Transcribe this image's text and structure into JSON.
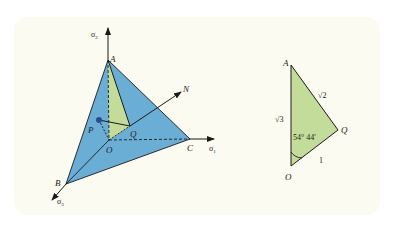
{
  "figure": {
    "background": "#fbfbf2",
    "colors": {
      "plane_fill": "#6aaed6",
      "triangle_fill": "#c4dc9a",
      "line": "#1a1a1a",
      "point": "#2e4a8f"
    },
    "left_diagram": {
      "axes": [
        {
          "label": "σ",
          "sub": "2",
          "direction": "up"
        },
        {
          "label": "σ",
          "sub": "1",
          "direction": "right"
        },
        {
          "label": "σ",
          "sub": "3",
          "direction": "down-left"
        }
      ],
      "points": {
        "A": "A",
        "B": "B",
        "C": "C",
        "O": "O",
        "P": "P",
        "Q": "Q",
        "N": "N"
      }
    },
    "right_diagram": {
      "vertices": {
        "A": "A",
        "Q": "Q",
        "O": "O"
      },
      "side_AO": "√3",
      "side_AQ": "√2",
      "side_OQ": "1",
      "angle_AOQ": "54° 44′"
    }
  }
}
